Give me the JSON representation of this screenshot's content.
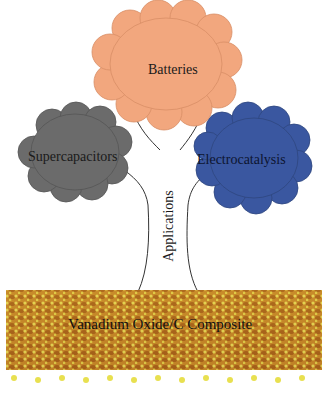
{
  "diagram": {
    "type": "tree",
    "trunk_label": "Applications",
    "base_label": "Vanadium Oxide/C Composite",
    "branches": [
      {
        "label": "Batteries",
        "color": "#f2a77e"
      },
      {
        "label": "Supercapacitors",
        "color": "#6b6b6b"
      },
      {
        "label": "Electrocatalysis",
        "color": "#3a57a0"
      }
    ],
    "base_colors": {
      "orange": "#b8731f",
      "yellow": "#e8e050"
    }
  }
}
